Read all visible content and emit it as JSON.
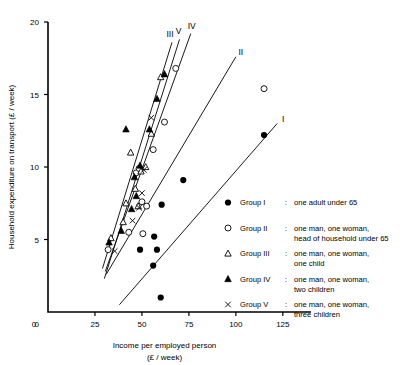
{
  "chart_data": {
    "type": "scatter",
    "title": "",
    "xlabel": "Income per employed person (£ / week)",
    "xlabel_line1": "Income per employed person",
    "xlabel_line2": "(£ / week)",
    "ylabel": "Household expenditure on transport (£ / week)",
    "xlim": [
      0,
      140
    ],
    "ylim": [
      0,
      20
    ],
    "xticks": [
      0,
      25,
      50,
      75,
      100,
      125
    ],
    "xtick_labels": [
      "0",
      "25",
      "50",
      "75",
      "100",
      "125"
    ],
    "yticks": [
      0,
      5,
      10,
      15,
      20
    ],
    "ytick_labels": [
      "0",
      "5",
      "10",
      "15",
      "20"
    ],
    "grid": false,
    "legend_position": "right",
    "series": [
      {
        "name": "Group I",
        "marker": "filled-circle",
        "label": "Group I",
        "description_line1": "one adult under 65",
        "description_line2": "",
        "points": [
          [
            60.0,
            1.0
          ],
          [
            56.0,
            3.2
          ],
          [
            49.0,
            4.3
          ],
          [
            58.0,
            4.3
          ],
          [
            56.5,
            5.2
          ],
          [
            60.5,
            7.4
          ],
          [
            72.0,
            9.1
          ],
          [
            115.0,
            12.2
          ]
        ],
        "fit_line": {
          "label": "I",
          "x1": 38.0,
          "y1": 0.5,
          "x2": 122.0,
          "y2": 13.0
        }
      },
      {
        "name": "Group II",
        "marker": "open-circle",
        "label": "Group II",
        "description_line1": "one man, one woman,",
        "description_line2": "head of household under 65",
        "points": [
          [
            32.0,
            4.3
          ],
          [
            43.0,
            5.5
          ],
          [
            50.5,
            5.4
          ],
          [
            52.5,
            7.3
          ],
          [
            50.0,
            7.6
          ],
          [
            47.0,
            9.6
          ],
          [
            48.5,
            9.9
          ],
          [
            56.0,
            11.2
          ],
          [
            62.0,
            13.1
          ],
          [
            68.0,
            16.8
          ],
          [
            115.0,
            15.4
          ]
        ],
        "fit_line": {
          "label": "II",
          "x1": 31.0,
          "y1": 2.6,
          "x2": 100.0,
          "y2": 17.6
        }
      },
      {
        "name": "Group III",
        "marker": "open-triangle",
        "label": "Group III",
        "description_line1": "one man, one woman,",
        "description_line2": "one child",
        "points": [
          [
            33.5,
            5.1
          ],
          [
            40.0,
            6.2
          ],
          [
            41.5,
            7.5
          ],
          [
            48.0,
            7.3
          ],
          [
            46.5,
            8.5
          ],
          [
            49.5,
            9.7
          ],
          [
            44.0,
            11.0
          ],
          [
            52.0,
            10.0
          ],
          [
            55.0,
            12.3
          ],
          [
            60.0,
            16.2
          ]
        ],
        "fit_line": {
          "label": "III",
          "x1": 29.0,
          "y1": 3.0,
          "x2": 66.0,
          "y2": 18.6
        }
      },
      {
        "name": "Group IV",
        "marker": "filled-triangle",
        "label": "Group IV",
        "description_line1": "one man, one woman,",
        "description_line2": "two children",
        "points": [
          [
            32.5,
            4.8
          ],
          [
            39.0,
            5.6
          ],
          [
            44.5,
            7.1
          ],
          [
            47.0,
            8.0
          ],
          [
            46.0,
            9.3
          ],
          [
            49.0,
            10.1
          ],
          [
            41.5,
            12.6
          ],
          [
            54.0,
            12.6
          ],
          [
            58.0,
            14.7
          ],
          [
            62.0,
            16.4
          ]
        ],
        "fit_line": {
          "label": "IV",
          "x1": 30.5,
          "y1": 2.8,
          "x2": 76.0,
          "y2": 19.2
        }
      },
      {
        "name": "Group V",
        "marker": "cross",
        "label": "Group V",
        "description_line1": "one man, one woman,",
        "description_line2": "three children",
        "points": [
          [
            35.5,
            4.2
          ],
          [
            45.0,
            6.3
          ],
          [
            48.5,
            7.2
          ],
          [
            50.0,
            8.2
          ],
          [
            51.0,
            9.8
          ],
          [
            55.0,
            13.4
          ]
        ],
        "fit_line": {
          "label": "V",
          "x1": 30.0,
          "y1": 2.3,
          "x2": 70.0,
          "y2": 18.8
        }
      }
    ]
  },
  "legend": {
    "separator": ":"
  }
}
